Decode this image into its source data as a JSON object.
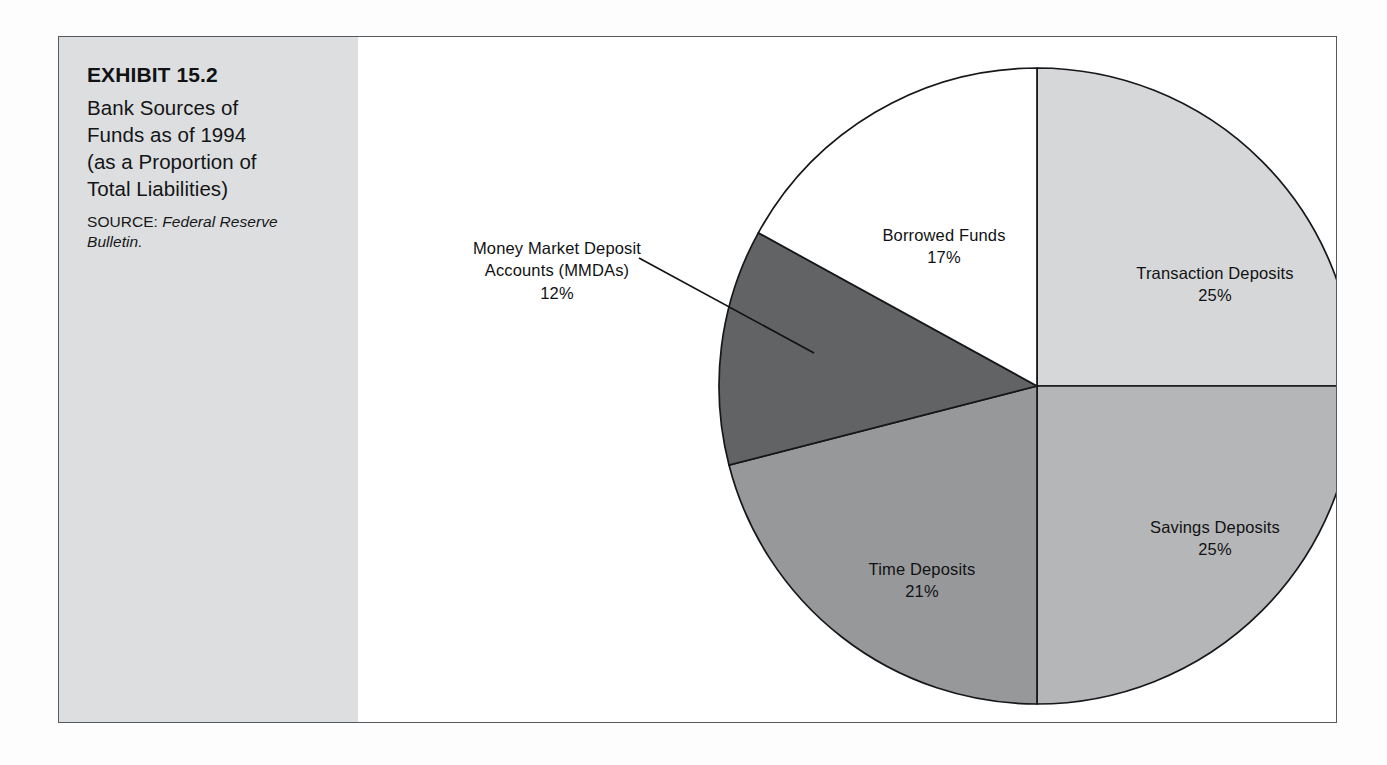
{
  "figure": {
    "exhibit_number_label": "EXHIBIT 15.2",
    "title": "Bank Sources of Funds as of 1994 (as a Proportion of Total Liabilities)",
    "title_lines": [
      "Bank Sources of",
      "Funds as of 1994",
      "(as a Proportion of",
      "Total Liabilities)"
    ],
    "source_label": "SOURCE:",
    "source_reference": "Federal Reserve Bulletin.",
    "panel_background": "#dddedf",
    "frame_color": "#555a5e"
  },
  "chart_data": {
    "type": "pie",
    "title": "Bank Sources of Funds as of 1994 (as a Proportion of Total Liabilities)",
    "xlabel": "",
    "ylabel": "",
    "unit": "percent of total liabilities",
    "total": 100,
    "legend_position": "none",
    "labels_inline": true,
    "categories": [
      "Transaction Deposits",
      "Savings Deposits",
      "Time Deposits",
      "Money Market Deposit Accounts (MMDAs)",
      "Borrowed Funds"
    ],
    "values": [
      25,
      25,
      21,
      12,
      17
    ],
    "slices": [
      {
        "name": "Transaction Deposits",
        "label": "Transaction Deposits",
        "value": 25,
        "value_text": "25%",
        "color": "#d6d7d8",
        "start_deg": 0,
        "end_deg": 90,
        "label_placement": "inside"
      },
      {
        "name": "Savings Deposits",
        "label": "Savings Deposits",
        "value": 25,
        "value_text": "25%",
        "color": "#b5b6b7",
        "start_deg": 90,
        "end_deg": 180,
        "label_placement": "inside"
      },
      {
        "name": "Time Deposits",
        "label": "Time Deposits",
        "value": 21,
        "value_text": "21%",
        "color": "#979899",
        "start_deg": 180,
        "end_deg": 255.6,
        "label_placement": "inside"
      },
      {
        "name": "Money Market Deposit Accounts (MMDAs)",
        "label": "Money Market Deposit Accounts (MMDAs)",
        "label_lines": [
          "Money Market Deposit",
          "Accounts (MMDAs)"
        ],
        "value": 12,
        "value_text": "12%",
        "color": "#626364",
        "start_deg": 255.6,
        "end_deg": 298.8,
        "label_placement": "outside-leader"
      },
      {
        "name": "Borrowed Funds",
        "label": "Borrowed Funds",
        "value": 17,
        "value_text": "17%",
        "color": "#ffffff",
        "start_deg": 298.8,
        "end_deg": 360,
        "label_placement": "inside"
      }
    ]
  }
}
